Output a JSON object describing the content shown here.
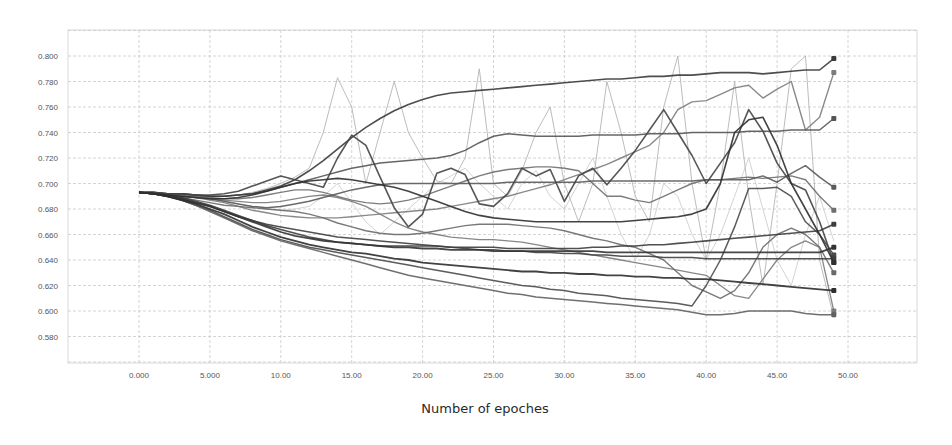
{
  "chart_data": {
    "type": "line",
    "title": "",
    "xlabel": "Number of epoches",
    "ylabel": "",
    "xlim": [
      -5,
      55
    ],
    "ylim": [
      0.56,
      0.82
    ],
    "grid": true,
    "legend": "none",
    "x_ticks": [
      "0.000",
      "5.000",
      "10.00",
      "15.00",
      "20.00",
      "25.00",
      "30.00",
      "35.00",
      "40.00",
      "45.00",
      "50.00"
    ],
    "y_ticks": [
      "0.800",
      "0.780",
      "0.760",
      "0.740",
      "0.720",
      "0.700",
      "0.680",
      "0.660",
      "0.640",
      "0.620",
      "0.600",
      "0.580"
    ],
    "x": [
      0,
      1,
      2,
      3,
      4,
      5,
      6,
      7,
      8,
      9,
      10,
      11,
      12,
      13,
      14,
      15,
      16,
      17,
      18,
      19,
      20,
      21,
      22,
      23,
      24,
      25,
      26,
      27,
      28,
      29,
      30,
      31,
      32,
      33,
      34,
      35,
      36,
      37,
      38,
      39,
      40,
      41,
      42,
      43,
      44,
      45,
      46,
      47,
      48,
      49
    ],
    "series": [
      {
        "name": "run-1",
        "color": "#3a3a3a",
        "width": 1.6,
        "values": [
          0.693,
          0.693,
          0.692,
          0.692,
          0.691,
          0.69,
          0.69,
          0.691,
          0.692,
          0.695,
          0.698,
          0.703,
          0.71,
          0.718,
          0.727,
          0.736,
          0.744,
          0.751,
          0.757,
          0.762,
          0.766,
          0.769,
          0.771,
          0.772,
          0.773,
          0.774,
          0.775,
          0.776,
          0.777,
          0.778,
          0.779,
          0.78,
          0.781,
          0.782,
          0.782,
          0.783,
          0.784,
          0.784,
          0.785,
          0.785,
          0.786,
          0.787,
          0.787,
          0.787,
          0.786,
          0.787,
          0.788,
          0.789,
          0.789,
          0.798
        ]
      },
      {
        "name": "run-2",
        "color": "#555555",
        "width": 1.5,
        "values": [
          0.693,
          0.693,
          0.692,
          0.692,
          0.691,
          0.69,
          0.69,
          0.691,
          0.692,
          0.694,
          0.697,
          0.7,
          0.703,
          0.706,
          0.709,
          0.712,
          0.714,
          0.716,
          0.717,
          0.718,
          0.719,
          0.72,
          0.722,
          0.726,
          0.732,
          0.737,
          0.739,
          0.738,
          0.737,
          0.737,
          0.737,
          0.737,
          0.738,
          0.738,
          0.738,
          0.738,
          0.739,
          0.739,
          0.739,
          0.74,
          0.74,
          0.74,
          0.74,
          0.741,
          0.741,
          0.741,
          0.742,
          0.742,
          0.742,
          0.751
        ]
      },
      {
        "name": "run-3",
        "color": "#6e6e6e",
        "width": 1.4,
        "values": [
          0.693,
          0.693,
          0.692,
          0.691,
          0.69,
          0.689,
          0.688,
          0.688,
          0.689,
          0.691,
          0.693,
          0.695,
          0.695,
          0.693,
          0.69,
          0.687,
          0.685,
          0.684,
          0.685,
          0.687,
          0.69,
          0.694,
          0.698,
          0.702,
          0.706,
          0.709,
          0.711,
          0.712,
          0.713,
          0.713,
          0.712,
          0.71,
          0.7,
          0.69,
          0.69,
          0.687,
          0.685,
          0.69,
          0.695,
          0.7,
          0.703,
          0.703,
          0.704,
          0.705,
          0.704,
          0.705,
          0.706,
          0.703,
          0.69,
          0.679
        ]
      },
      {
        "name": "run-4",
        "color": "#444444",
        "width": 1.6,
        "values": [
          0.693,
          0.693,
          0.692,
          0.692,
          0.691,
          0.691,
          0.692,
          0.694,
          0.698,
          0.702,
          0.706,
          0.703,
          0.7,
          0.697,
          0.72,
          0.738,
          0.73,
          0.705,
          0.681,
          0.666,
          0.676,
          0.708,
          0.712,
          0.707,
          0.684,
          0.682,
          0.692,
          0.712,
          0.706,
          0.711,
          0.686,
          0.706,
          0.712,
          0.699,
          0.712,
          0.726,
          0.742,
          0.758,
          0.74,
          0.722,
          0.7,
          0.716,
          0.732,
          0.758,
          0.741,
          0.716,
          0.7,
          0.695,
          0.67,
          0.638
        ]
      },
      {
        "name": "run-5",
        "color": "#5a5a5a",
        "width": 1.5,
        "values": [
          0.693,
          0.692,
          0.691,
          0.69,
          0.689,
          0.688,
          0.686,
          0.684,
          0.682,
          0.681,
          0.682,
          0.684,
          0.686,
          0.689,
          0.692,
          0.695,
          0.697,
          0.699,
          0.7,
          0.7,
          0.7,
          0.7,
          0.7,
          0.7,
          0.7,
          0.7,
          0.701,
          0.701,
          0.701,
          0.701,
          0.701,
          0.701,
          0.702,
          0.702,
          0.702,
          0.702,
          0.702,
          0.702,
          0.702,
          0.702,
          0.703,
          0.703,
          0.703,
          0.703,
          0.706,
          0.701,
          0.708,
          0.714,
          0.705,
          0.697
        ]
      },
      {
        "name": "run-6",
        "color": "#7c7c7c",
        "width": 1.4,
        "values": [
          0.693,
          0.692,
          0.691,
          0.69,
          0.689,
          0.687,
          0.685,
          0.682,
          0.679,
          0.677,
          0.675,
          0.674,
          0.673,
          0.673,
          0.673,
          0.674,
          0.675,
          0.676,
          0.677,
          0.678,
          0.679,
          0.68,
          0.682,
          0.684,
          0.686,
          0.688,
          0.69,
          0.693,
          0.696,
          0.699,
          0.703,
          0.707,
          0.711,
          0.715,
          0.72,
          0.725,
          0.73,
          0.74,
          0.758,
          0.764,
          0.765,
          0.77,
          0.775,
          0.777,
          0.767,
          0.774,
          0.78,
          0.742,
          0.752,
          0.787
        ]
      },
      {
        "name": "run-7",
        "color": "#333333",
        "width": 1.8,
        "values": [
          0.693,
          0.692,
          0.69,
          0.688,
          0.685,
          0.682,
          0.678,
          0.674,
          0.67,
          0.666,
          0.662,
          0.659,
          0.657,
          0.655,
          0.654,
          0.653,
          0.652,
          0.651,
          0.65,
          0.65,
          0.649,
          0.649,
          0.648,
          0.648,
          0.648,
          0.647,
          0.647,
          0.647,
          0.647,
          0.647,
          0.647,
          0.647,
          0.647,
          0.646,
          0.646,
          0.646,
          0.646,
          0.646,
          0.646,
          0.646,
          0.646,
          0.646,
          0.646,
          0.646,
          0.646,
          0.646,
          0.646,
          0.646,
          0.646,
          0.65
        ]
      },
      {
        "name": "run-8",
        "color": "#3d3d3d",
        "width": 1.6,
        "values": [
          0.693,
          0.692,
          0.691,
          0.689,
          0.686,
          0.683,
          0.679,
          0.675,
          0.671,
          0.667,
          0.664,
          0.661,
          0.658,
          0.656,
          0.654,
          0.653,
          0.652,
          0.651,
          0.651,
          0.651,
          0.651,
          0.651,
          0.65,
          0.65,
          0.65,
          0.65,
          0.649,
          0.649,
          0.649,
          0.649,
          0.649,
          0.649,
          0.65,
          0.65,
          0.651,
          0.651,
          0.652,
          0.652,
          0.653,
          0.654,
          0.655,
          0.656,
          0.657,
          0.658,
          0.659,
          0.66,
          0.661,
          0.662,
          0.663,
          0.668
        ]
      },
      {
        "name": "run-9",
        "color": "#2e2e2e",
        "width": 1.8,
        "values": [
          0.693,
          0.692,
          0.69,
          0.687,
          0.684,
          0.68,
          0.676,
          0.671,
          0.666,
          0.662,
          0.658,
          0.655,
          0.652,
          0.65,
          0.648,
          0.646,
          0.645,
          0.643,
          0.641,
          0.64,
          0.638,
          0.637,
          0.636,
          0.635,
          0.634,
          0.633,
          0.632,
          0.631,
          0.631,
          0.63,
          0.63,
          0.629,
          0.629,
          0.628,
          0.628,
          0.627,
          0.627,
          0.626,
          0.626,
          0.625,
          0.625,
          0.624,
          0.623,
          0.622,
          0.621,
          0.62,
          0.619,
          0.618,
          0.617,
          0.616
        ]
      },
      {
        "name": "run-10",
        "color": "#4a4a4a",
        "width": 1.5,
        "values": [
          0.693,
          0.692,
          0.69,
          0.687,
          0.683,
          0.679,
          0.674,
          0.669,
          0.664,
          0.66,
          0.656,
          0.653,
          0.65,
          0.648,
          0.646,
          0.644,
          0.642,
          0.64,
          0.638,
          0.636,
          0.634,
          0.632,
          0.63,
          0.628,
          0.626,
          0.624,
          0.622,
          0.62,
          0.619,
          0.617,
          0.616,
          0.614,
          0.613,
          0.612,
          0.61,
          0.609,
          0.608,
          0.607,
          0.606,
          0.604,
          0.62,
          0.64,
          0.666,
          0.696,
          0.696,
          0.697,
          0.69,
          0.67,
          0.66,
          0.644
        ]
      },
      {
        "name": "run-11",
        "color": "#606060",
        "width": 1.5,
        "values": [
          0.693,
          0.692,
          0.69,
          0.687,
          0.683,
          0.678,
          0.673,
          0.668,
          0.663,
          0.659,
          0.655,
          0.652,
          0.649,
          0.646,
          0.643,
          0.64,
          0.637,
          0.634,
          0.631,
          0.628,
          0.626,
          0.624,
          0.622,
          0.62,
          0.618,
          0.616,
          0.614,
          0.613,
          0.611,
          0.61,
          0.609,
          0.608,
          0.607,
          0.606,
          0.605,
          0.604,
          0.603,
          0.602,
          0.601,
          0.599,
          0.597,
          0.597,
          0.598,
          0.6,
          0.6,
          0.6,
          0.6,
          0.598,
          0.597,
          0.597
        ]
      },
      {
        "name": "run-12",
        "color": "#3f3f3f",
        "width": 1.5,
        "values": [
          0.693,
          0.692,
          0.69,
          0.688,
          0.685,
          0.682,
          0.678,
          0.674,
          0.671,
          0.668,
          0.666,
          0.664,
          0.662,
          0.66,
          0.658,
          0.657,
          0.656,
          0.655,
          0.654,
          0.653,
          0.652,
          0.651,
          0.65,
          0.649,
          0.648,
          0.648,
          0.647,
          0.647,
          0.646,
          0.646,
          0.645,
          0.645,
          0.644,
          0.644,
          0.643,
          0.643,
          0.643,
          0.642,
          0.642,
          0.642,
          0.641,
          0.641,
          0.641,
          0.641,
          0.641,
          0.641,
          0.641,
          0.641,
          0.641,
          0.641
        ]
      },
      {
        "name": "run-13",
        "color": "#6a6a6a",
        "width": 1.4,
        "values": [
          0.693,
          0.692,
          0.691,
          0.689,
          0.687,
          0.685,
          0.683,
          0.682,
          0.681,
          0.68,
          0.679,
          0.678,
          0.676,
          0.673,
          0.669,
          0.666,
          0.663,
          0.661,
          0.66,
          0.66,
          0.661,
          0.663,
          0.665,
          0.667,
          0.668,
          0.668,
          0.668,
          0.667,
          0.666,
          0.665,
          0.663,
          0.66,
          0.657,
          0.655,
          0.652,
          0.65,
          0.645,
          0.64,
          0.63,
          0.62,
          0.615,
          0.61,
          0.616,
          0.63,
          0.65,
          0.66,
          0.665,
          0.66,
          0.65,
          0.63
        ]
      },
      {
        "name": "run-14",
        "color": "#2f2f2f",
        "width": 1.6,
        "values": [
          0.693,
          0.692,
          0.691,
          0.69,
          0.689,
          0.688,
          0.688,
          0.689,
          0.691,
          0.694,
          0.697,
          0.7,
          0.702,
          0.703,
          0.704,
          0.703,
          0.701,
          0.699,
          0.697,
          0.694,
          0.69,
          0.686,
          0.682,
          0.678,
          0.675,
          0.673,
          0.672,
          0.671,
          0.67,
          0.67,
          0.67,
          0.67,
          0.67,
          0.67,
          0.67,
          0.671,
          0.672,
          0.673,
          0.674,
          0.676,
          0.68,
          0.7,
          0.74,
          0.75,
          0.752,
          0.73,
          0.7,
          0.68,
          0.66,
          0.638
        ]
      },
      {
        "name": "run-15",
        "color": "#7a7a7a",
        "width": 1.3,
        "values": [
          0.693,
          0.692,
          0.691,
          0.69,
          0.689,
          0.688,
          0.687,
          0.686,
          0.685,
          0.685,
          0.686,
          0.688,
          0.69,
          0.691,
          0.689,
          0.686,
          0.682,
          0.676,
          0.67,
          0.665,
          0.662,
          0.66,
          0.658,
          0.657,
          0.656,
          0.656,
          0.655,
          0.654,
          0.652,
          0.65,
          0.648,
          0.646,
          0.644,
          0.642,
          0.64,
          0.638,
          0.636,
          0.634,
          0.632,
          0.63,
          0.628,
          0.62,
          0.612,
          0.61,
          0.625,
          0.64,
          0.65,
          0.655,
          0.65,
          0.6
        ]
      },
      {
        "name": "run-16",
        "color": "#b5b5b5",
        "width": 1.0,
        "values": [
          0.693,
          0.692,
          0.691,
          0.69,
          0.69,
          0.69,
          0.69,
          0.691,
          0.693,
          0.696,
          0.7,
          0.705,
          0.712,
          0.74,
          0.783,
          0.76,
          0.7,
          0.74,
          0.78,
          0.74,
          0.72,
          0.702,
          0.7,
          0.72,
          0.79,
          0.7,
          0.69,
          0.71,
          0.74,
          0.76,
          0.7,
          0.67,
          0.7,
          0.78,
          0.74,
          0.69,
          0.67,
          0.76,
          0.8,
          0.7,
          0.64,
          0.7,
          0.78,
          0.69,
          0.62,
          0.7,
          0.79,
          0.8,
          0.64,
          0.595
        ]
      },
      {
        "name": "run-17",
        "color": "#c8c8c8",
        "width": 0.9,
        "values": [
          0.693,
          0.692,
          0.691,
          0.69,
          0.689,
          0.688,
          0.686,
          0.684,
          0.682,
          0.68,
          0.679,
          0.68,
          0.682,
          0.69,
          0.7,
          0.685,
          0.67,
          0.66,
          0.67,
          0.68,
          0.69,
          0.7,
          0.706,
          0.712,
          0.7,
          0.69,
          0.68,
          0.7,
          0.71,
          0.69,
          0.68,
          0.7,
          0.72,
          0.69,
          0.66,
          0.64,
          0.66,
          0.7,
          0.69,
          0.66,
          0.64,
          0.66,
          0.69,
          0.72,
          0.68,
          0.64,
          0.62,
          0.66,
          0.69,
          0.655
        ]
      }
    ]
  }
}
